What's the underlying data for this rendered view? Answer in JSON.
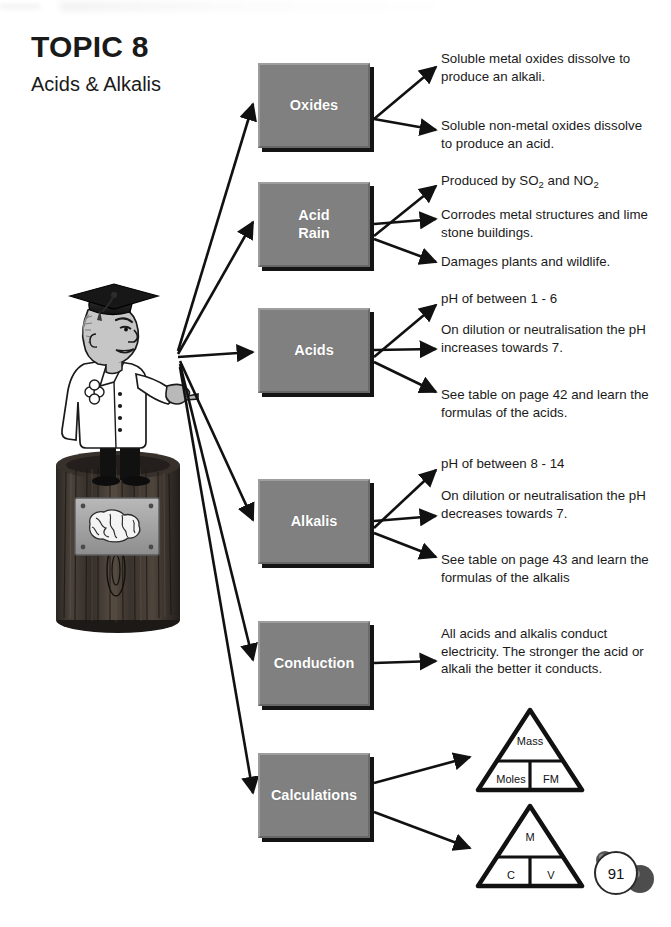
{
  "header": {
    "topic_title": "TOPIC 8",
    "topic_subtitle": "Acids & Alkalis"
  },
  "page_number": "91",
  "colors": {
    "node_fill": "#808080",
    "node_text": "#ffffff",
    "node_bevel_light": "#9e9e9e",
    "node_bevel_dark": "#676767",
    "ink": "#1a1a1a",
    "paper": "#ffffff"
  },
  "illustration": {
    "character": "professor-with-mortarboard-pointing",
    "pedestal": "wooden-plinth-with-brain-plaque",
    "plaque_image": "brain"
  },
  "diagram": {
    "nodes": [
      {
        "id": "oxides",
        "label": "Oxides",
        "x": 258,
        "y": 63,
        "w": 112,
        "h": 85
      },
      {
        "id": "acid-rain",
        "label": "Acid\nRain",
        "x": 258,
        "y": 182,
        "w": 112,
        "h": 85
      },
      {
        "id": "acids",
        "label": "Acids",
        "x": 258,
        "y": 308,
        "w": 112,
        "h": 85
      },
      {
        "id": "alkalis",
        "label": "Alkalis",
        "x": 258,
        "y": 479,
        "w": 112,
        "h": 85
      },
      {
        "id": "conduction",
        "label": "Conduction",
        "x": 258,
        "y": 621,
        "w": 112,
        "h": 85
      },
      {
        "id": "calculations",
        "label": "Calculations",
        "x": 258,
        "y": 753,
        "w": 112,
        "h": 85
      }
    ],
    "notes": [
      {
        "id": "oxides-1",
        "parent": "oxides",
        "x": 441,
        "y": 50,
        "w": 215,
        "text": "Soluble metal oxides dissolve to produce an alkali."
      },
      {
        "id": "oxides-2",
        "parent": "oxides",
        "x": 441,
        "y": 117,
        "w": 215,
        "text": "Soluble non-metal oxides dissolve to produce an acid."
      },
      {
        "id": "acidrain-1",
        "parent": "acid-rain",
        "x": 441,
        "y": 172,
        "w": 215,
        "html": "Produced by SO<sub>2</sub> and NO<sub>2</sub>"
      },
      {
        "id": "acidrain-2",
        "parent": "acid-rain",
        "x": 441,
        "y": 206,
        "w": 215,
        "text": "Corrodes metal structures and lime stone buildings."
      },
      {
        "id": "acidrain-3",
        "parent": "acid-rain",
        "x": 441,
        "y": 253,
        "w": 215,
        "text": "Damages plants and wildlife."
      },
      {
        "id": "acids-1",
        "parent": "acids",
        "x": 441,
        "y": 290,
        "w": 215,
        "text": "pH of between 1 - 6"
      },
      {
        "id": "acids-2",
        "parent": "acids",
        "x": 441,
        "y": 321,
        "w": 215,
        "text": "On dilution or neutralisation the pH increases towards 7."
      },
      {
        "id": "acids-3",
        "parent": "acids",
        "x": 441,
        "y": 386,
        "w": 215,
        "text": "See table on page 42 and learn the formulas of the acids."
      },
      {
        "id": "alkalis-1",
        "parent": "alkalis",
        "x": 441,
        "y": 455,
        "w": 215,
        "text": "pH of between 8 - 14"
      },
      {
        "id": "alkalis-2",
        "parent": "alkalis",
        "x": 441,
        "y": 487,
        "w": 215,
        "text": "On dilution or neutralisation the pH decreases towards 7."
      },
      {
        "id": "alkalis-3",
        "parent": "alkalis",
        "x": 441,
        "y": 551,
        "w": 215,
        "text": "See table on page 43 and learn the formulas of the alkalis"
      },
      {
        "id": "conduction-1",
        "parent": "conduction",
        "x": 441,
        "y": 625,
        "w": 215,
        "text": "All acids and alkalis conduct electricity. The stronger the acid or alkali the better it conducts."
      }
    ],
    "triangles": [
      {
        "id": "tri-mass",
        "top": "Mass",
        "left": "Moles",
        "right": "FM"
      },
      {
        "id": "tri-conc",
        "top": "M",
        "left": "C",
        "right": "V"
      }
    ]
  }
}
